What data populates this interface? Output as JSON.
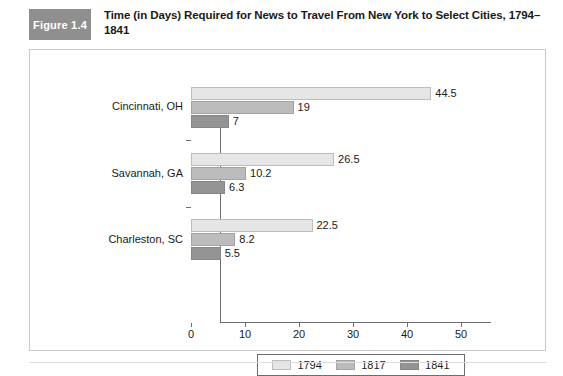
{
  "figure": {
    "badge_label": "Figure 1.4",
    "title": "Time (in Days) Required for News to Travel From New York to Select Cities, 1794–1841",
    "badge_color": "#8f8f8f",
    "panel_border_color": "#c9c9c9"
  },
  "chart_data": {
    "type": "bar",
    "orientation": "horizontal",
    "title": "Time (in Days) Required for News to Travel From New York to Select Cities, 1794–1841",
    "xlabel": "",
    "ylabel": "",
    "categories": [
      "Cincinnati, OH",
      "Savannah, GA",
      "Charleston, SC"
    ],
    "series": [
      {
        "name": "1794",
        "color": "#e6e6e6",
        "values": [
          44.5,
          26.5,
          22.5
        ],
        "labels": [
          "44.5",
          "26.5",
          "22.5"
        ]
      },
      {
        "name": "1817",
        "color": "#bcbcbc",
        "values": [
          19,
          10.2,
          8.2
        ],
        "labels": [
          "19",
          "10.2",
          "8.2"
        ]
      },
      {
        "name": "1841",
        "color": "#949494",
        "values": [
          7,
          6.3,
          5.5
        ],
        "labels": [
          "7",
          "6.3",
          "5.5"
        ]
      }
    ],
    "xlim": [
      0,
      50
    ],
    "xticks": [
      0,
      10,
      20,
      30,
      40,
      50
    ],
    "xtick_labels": [
      "0",
      "10",
      "20",
      "30",
      "40",
      "50"
    ],
    "grid": false,
    "legend": {
      "position": "bottom",
      "entries": [
        "1794",
        "1817",
        "1841"
      ]
    }
  }
}
